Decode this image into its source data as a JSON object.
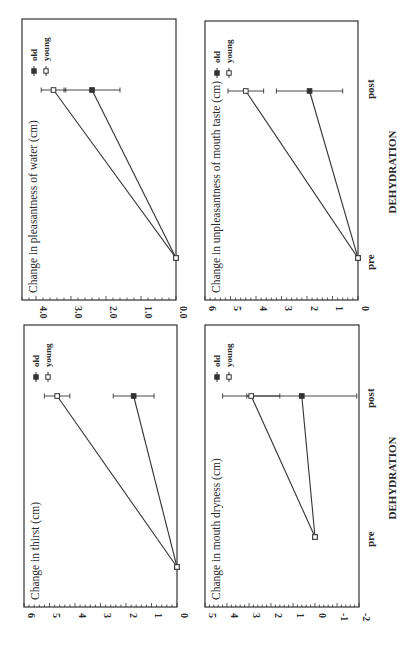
{
  "figure": {
    "orientation": "rotated 90 degrees counter-clockwise",
    "x_axis_label": "DEHYDRATION",
    "x_categories": [
      "pre",
      "post"
    ],
    "legend": [
      {
        "label": "old",
        "marker": "filled-square"
      },
      {
        "label": "young",
        "marker": "open-square"
      }
    ],
    "line_color": "#333333"
  },
  "chart_data": [
    {
      "type": "line",
      "title": "Change in thirst (cm)",
      "xlabel": "DEHYDRATION",
      "ylabel": "",
      "categories": [
        "pre",
        "post"
      ],
      "yticks": [
        "0",
        "1",
        "2",
        "3",
        "4",
        "5",
        "6"
      ],
      "ylim": [
        0,
        6
      ],
      "series": [
        {
          "name": "old",
          "values": [
            0,
            1.7
          ],
          "error": [
            0,
            0.8
          ]
        },
        {
          "name": "young",
          "values": [
            0,
            4.7
          ],
          "error": [
            0,
            0.5
          ]
        }
      ],
      "legend_position": "upper left"
    },
    {
      "type": "line",
      "title": "Change in pleasantness of water (cm)",
      "xlabel": "DEHYDRATION",
      "ylabel": "",
      "categories": [
        "pre",
        "post"
      ],
      "yticks": [
        "0.0",
        "1.0",
        "2.0",
        "3.0",
        "4.0"
      ],
      "ylim": [
        0,
        4.4
      ],
      "series": [
        {
          "name": "old",
          "values": [
            0,
            2.4
          ],
          "error": [
            0,
            0.8
          ]
        },
        {
          "name": "young",
          "values": [
            0,
            3.5
          ],
          "error": [
            0,
            0.35
          ]
        }
      ],
      "legend_position": "upper left"
    },
    {
      "type": "line",
      "title": "Change in mouth dryness (cm)",
      "xlabel": "DEHYDRATION",
      "ylabel": "",
      "categories": [
        "pre",
        "post"
      ],
      "yticks": [
        "-2",
        "-1",
        "0",
        "1",
        "2",
        "3",
        "4",
        "5"
      ],
      "ylim": [
        -2,
        5
      ],
      "series": [
        {
          "name": "old",
          "values": [
            0,
            0.6
          ],
          "error": [
            0,
            2.5
          ]
        },
        {
          "name": "young",
          "values": [
            0,
            2.9
          ],
          "error": [
            0,
            1.3
          ]
        }
      ],
      "legend_position": "upper left"
    },
    {
      "type": "line",
      "title": "Change in unpleasantness of mouth taste (cm)",
      "xlabel": "DEHYDRATION",
      "ylabel": "",
      "categories": [
        "pre",
        "post"
      ],
      "yticks": [
        "0",
        "1",
        "2",
        "3",
        "4",
        "5",
        "6"
      ],
      "ylim": [
        0,
        6
      ],
      "series": [
        {
          "name": "old",
          "values": [
            0,
            1.9
          ],
          "error": [
            0,
            1.3
          ]
        },
        {
          "name": "young",
          "values": [
            0,
            4.4
          ],
          "error": [
            0,
            0.7
          ]
        }
      ],
      "legend_position": "upper left"
    }
  ]
}
